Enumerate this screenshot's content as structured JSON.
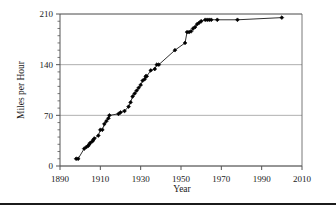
{
  "figure": {
    "background": "#ffffff",
    "line_color": "#1a1a1a",
    "marker_color": "#000000",
    "grid_color": "#9a9a9a",
    "axis_color": "#555555"
  },
  "chart_data": {
    "type": "line",
    "title": "",
    "xlabel": "Year",
    "ylabel": "Miles per Hour",
    "xlim": [
      1890,
      2010
    ],
    "ylim": [
      0,
      210
    ],
    "xticks": [
      1890,
      1910,
      1930,
      1950,
      1970,
      1990,
      2010
    ],
    "yticks": [
      0,
      70,
      140,
      210
    ],
    "xtick_labels": [
      "1890",
      "1910",
      "1930",
      "1950",
      "1970",
      "1990",
      "2010"
    ],
    "ytick_labels": [
      "0",
      "70",
      "140",
      "210"
    ],
    "x_minor_step": 0,
    "y_minor_step": 10,
    "grid": "horizontal",
    "legend": "none",
    "marker": "filled-diamond",
    "series": [
      {
        "name": "Land Speed Record",
        "x": [
          1898,
          1899,
          1902,
          1903,
          1904,
          1904.5,
          1905,
          1906,
          1906.5,
          1907,
          1909,
          1910,
          1911,
          1912,
          1913,
          1914,
          1914.5,
          1919,
          1920,
          1922,
          1924,
          1925,
          1926,
          1927,
          1928,
          1929,
          1930,
          1931,
          1932,
          1932.5,
          1933,
          1935,
          1937,
          1938,
          1939,
          1947,
          1952,
          1953,
          1954,
          1955,
          1956,
          1957,
          1958,
          1959,
          1960,
          1962,
          1963,
          1964,
          1965,
          1968,
          1978,
          2000
        ],
        "y": [
          10,
          10,
          24,
          26,
          28,
          30,
          32,
          34,
          36,
          38,
          42,
          50,
          50,
          58,
          62,
          66,
          70,
          72,
          74,
          76,
          82,
          88,
          96,
          100,
          104,
          108,
          112,
          118,
          120,
          124,
          124,
          132,
          134,
          140,
          140,
          160,
          170,
          185,
          185,
          186,
          190,
          192,
          196,
          198,
          200,
          202,
          202,
          202,
          202,
          202,
          202,
          205
        ]
      }
    ]
  },
  "axis_labels": {
    "y": "Miles per Hour",
    "x": "Year"
  }
}
